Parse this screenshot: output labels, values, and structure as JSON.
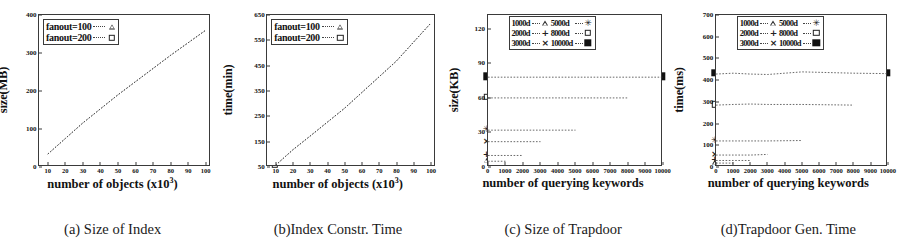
{
  "figure": {
    "panels": [
      {
        "id": "a",
        "caption": "(a) Size of Index",
        "chart_data": {
          "type": "line",
          "title": "",
          "xlabel": "number of objects (x10",
          "xlabel_sup": "3",
          "xlabel_tail": ")",
          "ylabel": "size(MB)",
          "xlim": [
            5,
            103
          ],
          "ylim": [
            0,
            400
          ],
          "xticks": [
            10,
            20,
            30,
            40,
            50,
            60,
            70,
            80,
            90,
            100
          ],
          "yticks": [
            0,
            100,
            200,
            300,
            400
          ],
          "grid": false,
          "legend_position": "top-left",
          "x": [
            10,
            20,
            30,
            50,
            80,
            100
          ],
          "series": [
            {
              "name": "fanout=100",
              "marker": "triangle",
              "values": [
                34,
                75,
                116,
                190,
                294,
                360
              ]
            },
            {
              "name": "fanout=200",
              "marker": "square-open",
              "values": [
                34,
                75,
                116,
                190,
                294,
                360
              ]
            }
          ]
        }
      },
      {
        "id": "b",
        "caption": "(b)Index Constr. Time",
        "chart_data": {
          "type": "line",
          "title": "",
          "xlabel": "number of objects (x10",
          "xlabel_sup": "3",
          "xlabel_tail": ")",
          "ylabel": "time(min)",
          "xlim": [
            5,
            103
          ],
          "ylim": [
            50,
            650
          ],
          "xticks": [
            10,
            20,
            30,
            40,
            50,
            60,
            70,
            80,
            90,
            100
          ],
          "yticks": [
            50,
            150,
            250,
            350,
            450,
            550,
            650
          ],
          "grid": false,
          "legend_position": "top-left",
          "x": [
            10,
            20,
            30,
            50,
            80,
            100
          ],
          "series": [
            {
              "name": "fanout=100",
              "marker": "triangle",
              "values": [
                57,
                118,
                172,
                282,
                468,
                618
              ]
            },
            {
              "name": "fanout=200",
              "marker": "square-open",
              "values": [
                57,
                118,
                172,
                282,
                468,
                618
              ]
            }
          ]
        }
      },
      {
        "id": "c",
        "caption": "(c) Size of Trapdoor",
        "chart_data": {
          "type": "line",
          "title": "",
          "xlabel": "number of querying keywords",
          "ylabel": "size(KB)",
          "xlim": [
            0,
            10000
          ],
          "ylim": [
            0,
            132
          ],
          "xticks": [
            0,
            1000,
            2000,
            3000,
            4000,
            5000,
            6000,
            7000,
            8000,
            9000,
            10000
          ],
          "yticks": [
            0,
            30,
            60,
            90,
            120
          ],
          "grid": false,
          "legend_position": "top-center",
          "series": [
            {
              "name": "1000d",
              "marker": "triangle",
              "x": [
                0,
                1000
              ],
              "values": [
                5,
                5
              ]
            },
            {
              "name": "2000d",
              "marker": "plus",
              "x": [
                0,
                1000,
                2000
              ],
              "values": [
                10,
                10,
                10
              ]
            },
            {
              "name": "3000d",
              "marker": "cross",
              "x": [
                0,
                1000,
                2000,
                3000
              ],
              "values": [
                22,
                22,
                22,
                22
              ]
            },
            {
              "name": "5000d",
              "marker": "star",
              "x": [
                0,
                1000,
                2000,
                3000,
                5000
              ],
              "values": [
                32,
                32,
                32,
                32,
                32
              ]
            },
            {
              "name": "8000d",
              "marker": "square-open",
              "x": [
                0,
                1000,
                2000,
                3000,
                5000,
                8000
              ],
              "values": [
                60,
                60,
                60,
                60,
                60,
                60
              ]
            },
            {
              "name": "10000d",
              "marker": "square-filled",
              "x": [
                0,
                1000,
                2000,
                3000,
                5000,
                8000,
                10000
              ],
              "values": [
                78,
                78,
                78,
                78,
                78,
                78,
                78
              ]
            }
          ]
        }
      },
      {
        "id": "d",
        "caption": "(d)Trapdoor Gen. Time",
        "chart_data": {
          "type": "line",
          "title": "",
          "xlabel": "number of querying keywords",
          "ylabel": "time(ms)",
          "xlim": [
            0,
            10000
          ],
          "ylim": [
            0,
            700
          ],
          "xticks": [
            0,
            1000,
            2000,
            3000,
            4000,
            5000,
            6000,
            7000,
            8000,
            9000,
            10000
          ],
          "yticks": [
            0,
            100,
            200,
            300,
            400,
            500,
            600,
            700
          ],
          "grid": false,
          "legend_position": "top-center",
          "series": [
            {
              "name": "1000d",
              "marker": "triangle",
              "x": [
                0,
                1000
              ],
              "values": [
                18,
                18
              ]
            },
            {
              "name": "2000d",
              "marker": "plus",
              "x": [
                0,
                1000,
                2000
              ],
              "values": [
                30,
                30,
                30
              ]
            },
            {
              "name": "3000d",
              "marker": "cross",
              "x": [
                0,
                1000,
                2000,
                3000
              ],
              "values": [
                55,
                55,
                55,
                58
              ]
            },
            {
              "name": "5000d",
              "marker": "star",
              "x": [
                0,
                1000,
                2000,
                3000,
                5000
              ],
              "values": [
                120,
                120,
                120,
                120,
                122
              ]
            },
            {
              "name": "8000d",
              "marker": "square-open",
              "x": [
                0,
                1000,
                2000,
                3000,
                5000,
                8000
              ],
              "values": [
                285,
                288,
                290,
                288,
                288,
                285
              ]
            },
            {
              "name": "10000d",
              "marker": "square-filled",
              "x": [
                0,
                1000,
                2000,
                3000,
                5000,
                8000,
                10000
              ],
              "values": [
                428,
                432,
                428,
                426,
                438,
                432,
                430
              ]
            }
          ]
        }
      }
    ]
  }
}
